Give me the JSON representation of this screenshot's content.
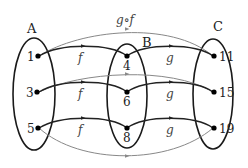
{
  "diagram": {
    "colors": {
      "ellipse": "#1a1a1a",
      "arrow": "#222222",
      "composite_arrow": "#888888",
      "dot": "#000000"
    },
    "sets": [
      {
        "name": "A",
        "elements": [
          "1",
          "3",
          "5"
        ]
      },
      {
        "name": "B",
        "elements": [
          "4",
          "6",
          "8"
        ]
      },
      {
        "name": "C",
        "elements": [
          "11",
          "15",
          "19"
        ]
      }
    ],
    "function_labels": {
      "f": "f",
      "g": "g",
      "composite": "g∘f"
    },
    "mappings": {
      "f": [
        [
          "1",
          "4"
        ],
        [
          "3",
          "6"
        ],
        [
          "5",
          "8"
        ]
      ],
      "g": [
        [
          "4",
          "11"
        ],
        [
          "6",
          "15"
        ],
        [
          "8",
          "19"
        ]
      ],
      "g_of_f": [
        [
          "1",
          "11"
        ],
        [
          "3",
          "15"
        ],
        [
          "5",
          "19"
        ]
      ]
    }
  }
}
